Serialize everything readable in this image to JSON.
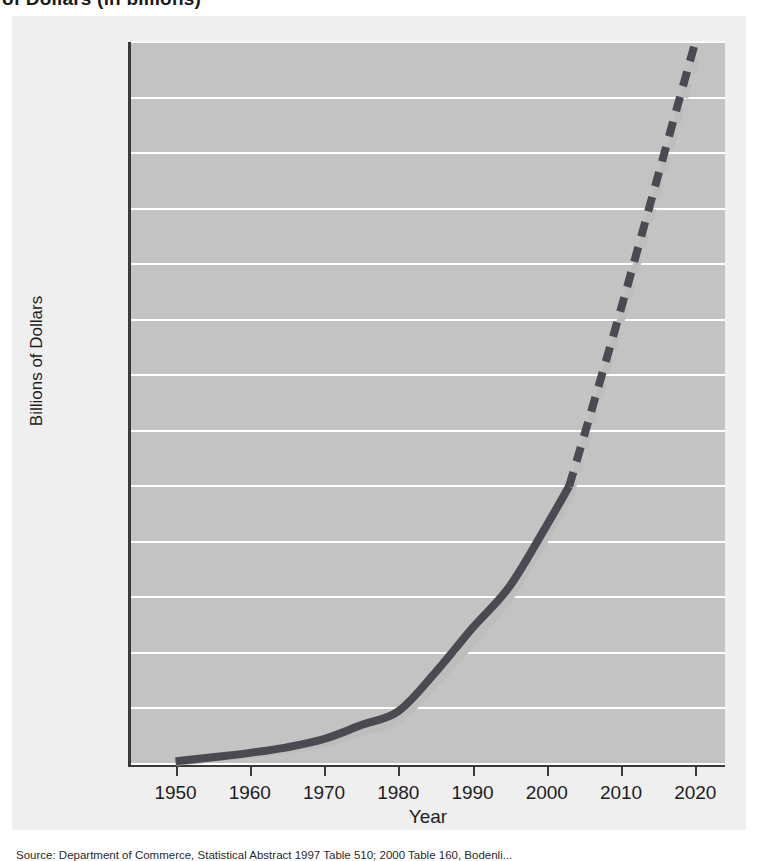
{
  "title": "of Dollars (in billions)",
  "source_note": "Source: Department of Commerce, Statistical Abstract 1997 Table 510; 2000 Table 160, Bodenli...",
  "axes": {
    "ylabel": "Billions of Dollars",
    "xlabel": "Year",
    "ytick_labels": [
      "$1,300",
      "1,200",
      "1,100",
      "1,000",
      "900",
      "800",
      "700",
      "600",
      "500",
      "400",
      "300",
      "200",
      "100",
      "0"
    ],
    "xtick_labels": [
      "1950",
      "1960",
      "1970",
      "1980",
      "1990",
      "2000",
      "2010",
      "2020"
    ]
  },
  "colors": {
    "plot_background": "#c3c3c3",
    "panel_background": "#efefef",
    "gridline": "#ffffff",
    "axis": "#3a3a3a",
    "series_dark": "#4a4a52",
    "series_light": "#bdbdbd",
    "text": "#1d1d1d"
  },
  "chart_data": {
    "type": "line",
    "title": "",
    "xlabel": "Year",
    "ylabel": "Billions of Dollars",
    "xlim": [
      1944,
      2024
    ],
    "ylim": [
      0,
      1300
    ],
    "grid": true,
    "legend": "none",
    "ytick_values": [
      0,
      100,
      200,
      300,
      400,
      500,
      600,
      700,
      800,
      900,
      1000,
      1100,
      1200,
      1300
    ],
    "xtick_values": [
      1950,
      1960,
      1970,
      1980,
      1990,
      2000,
      2010,
      2020
    ],
    "annotations": [
      "Solid segments are historical data through about 2003",
      "Dashed segments from about 2003 to 2020 are projections"
    ],
    "series": [
      {
        "name": "Upper estimate",
        "color": "#4a4a52",
        "style_historical": "solid",
        "style_projection": "dashed",
        "projection_start_year": 2003,
        "x": [
          1950,
          1955,
          1960,
          1965,
          1970,
          1975,
          1980,
          1985,
          1990,
          1995,
          2000,
          2003,
          2005,
          2010,
          2015,
          2020
        ],
        "y": [
          5,
          12,
          20,
          30,
          45,
          70,
          95,
          165,
          245,
          320,
          430,
          500,
          590,
          820,
          1060,
          1300
        ]
      },
      {
        "name": "Lower estimate",
        "color": "#bdbdbd",
        "style_historical": "solid",
        "style_projection": "dashed",
        "projection_start_year": 2003,
        "x": [
          1950,
          1955,
          1960,
          1965,
          1970,
          1975,
          1980,
          1985,
          1990,
          1995,
          2000,
          2003,
          2005,
          2010,
          2015,
          2020
        ],
        "y": [
          4,
          10,
          17,
          26,
          38,
          58,
          80,
          145,
          220,
          300,
          410,
          480,
          570,
          800,
          1035,
          1270
        ]
      }
    ]
  }
}
